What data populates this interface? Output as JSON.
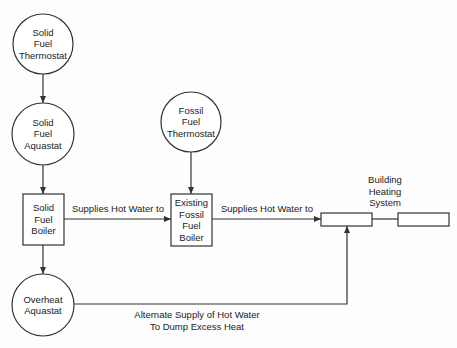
{
  "diagram": {
    "colors": {
      "stroke": "#333333",
      "text": "#222222",
      "background": "#fdfdfd"
    },
    "nodes": [
      {
        "id": "solid-fuel-thermostat",
        "shape": "circle",
        "cx": 43,
        "cy": 44,
        "r": 30,
        "lines": [
          "Solid",
          "Fuel",
          "Thermostat"
        ]
      },
      {
        "id": "solid-fuel-aquastat",
        "shape": "circle",
        "cx": 43,
        "cy": 134,
        "r": 31,
        "lines": [
          "Solid",
          "Fuel",
          "Aquastat"
        ]
      },
      {
        "id": "solid-fuel-boiler",
        "shape": "rect",
        "x": 23,
        "y": 194,
        "w": 41,
        "h": 51,
        "lines": [
          "Solid",
          "Fuel",
          "Boiler"
        ]
      },
      {
        "id": "overheat-aquastat",
        "shape": "circle",
        "cx": 43,
        "cy": 305,
        "r": 31,
        "lines": [
          "Overheat",
          "Aquastat"
        ]
      },
      {
        "id": "fossil-fuel-thermostat",
        "shape": "circle",
        "cx": 191,
        "cy": 122,
        "r": 30,
        "lines": [
          "Fossil",
          "Fuel",
          "Thermostat"
        ]
      },
      {
        "id": "existing-fossil-fuel-boiler",
        "shape": "rect",
        "x": 171,
        "y": 194,
        "w": 41,
        "h": 52,
        "lines": [
          "Existing",
          "Fossil",
          "Fuel",
          "Boiler"
        ]
      },
      {
        "id": "building-heating-unit-1",
        "shape": "rect",
        "x": 321,
        "y": 213,
        "w": 51,
        "h": 13,
        "lines": []
      },
      {
        "id": "building-heating-unit-2",
        "shape": "rect",
        "x": 398,
        "y": 213,
        "w": 51,
        "h": 13,
        "lines": []
      }
    ],
    "edges": [
      {
        "from": "solid-fuel-thermostat",
        "to": "solid-fuel-aquastat",
        "points": [
          [
            43,
            74
          ],
          [
            43,
            103
          ]
        ],
        "arrow": true
      },
      {
        "from": "solid-fuel-aquastat",
        "to": "solid-fuel-boiler",
        "points": [
          [
            43,
            165
          ],
          [
            43,
            194
          ]
        ],
        "arrow": true
      },
      {
        "from": "solid-fuel-boiler",
        "to": "overheat-aquastat",
        "points": [
          [
            43,
            245
          ],
          [
            43,
            274
          ]
        ],
        "arrow": true
      },
      {
        "from": "fossil-fuel-thermostat",
        "to": "existing-fossil-fuel-boiler",
        "points": [
          [
            191,
            152
          ],
          [
            191,
            194
          ]
        ],
        "arrow": true
      },
      {
        "from": "solid-fuel-boiler",
        "to": "existing-fossil-fuel-boiler",
        "points": [
          [
            64,
            219
          ],
          [
            171,
            219
          ]
        ],
        "arrow": true
      },
      {
        "from": "existing-fossil-fuel-boiler",
        "to": "building-heating-unit-1",
        "points": [
          [
            212,
            219
          ],
          [
            321,
            219
          ]
        ],
        "arrow": true
      },
      {
        "from": "building-heating-unit-1",
        "to": "building-heating-unit-2",
        "points": [
          [
            372,
            219
          ],
          [
            398,
            219
          ]
        ],
        "arrow": false
      },
      {
        "from": "overheat-aquastat",
        "to": "building-heating-unit-1",
        "points": [
          [
            74,
            304
          ],
          [
            347,
            304
          ],
          [
            347,
            226
          ]
        ],
        "arrow": true
      }
    ],
    "edge_labels": {
      "boiler_to_fossil": "Supplies Hot Water to",
      "fossil_to_building": "Supplies Hot Water to",
      "overheat_line1": "Alternate Supply of Hot Water",
      "overheat_line2": "To Dump Excess Heat"
    },
    "group_label": {
      "line1": "Building",
      "line2": "Heating",
      "line3": "System"
    }
  }
}
